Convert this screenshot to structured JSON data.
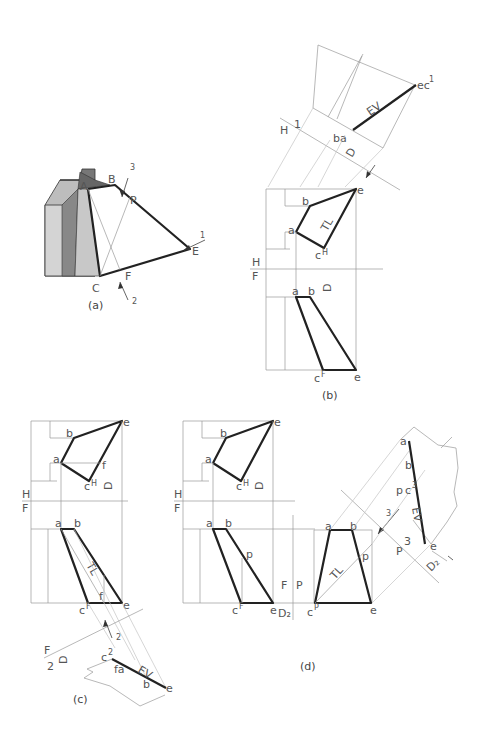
{
  "figure": {
    "panels": [
      {
        "id": "a",
        "caption": "(a)",
        "labels": [
          "A",
          "B",
          "P",
          "E",
          "F",
          "C"
        ],
        "arrows": [
          "1",
          "2",
          "3"
        ]
      },
      {
        "id": "b",
        "caption": "(b)",
        "fold_lines": [
          {
            "top": "H",
            "bottom": "F"
          },
          {
            "top": "H",
            "side": "1"
          }
        ],
        "top_view_labels": [
          "e",
          "b",
          "a",
          "c",
          "H",
          "TL"
        ],
        "front_view_labels": [
          "a",
          "b",
          "c",
          "F",
          "e"
        ],
        "aux_labels": [
          "ba",
          "ec",
          "1",
          "EV"
        ],
        "dimension": "D"
      },
      {
        "id": "c",
        "caption": "(c)",
        "fold_lines": [
          {
            "top": "H",
            "bottom": "F"
          },
          {
            "top": "F",
            "bottom": "2"
          }
        ],
        "top_view_labels": [
          "e",
          "b",
          "a",
          "f",
          "c",
          "H"
        ],
        "front_view_labels": [
          "a",
          "b",
          "TL",
          "f",
          "c",
          "F",
          "e"
        ],
        "aux_labels": [
          "c",
          "2",
          "f",
          "a",
          "EV",
          "b",
          "e"
        ],
        "dimension": "D",
        "arrow": "2"
      },
      {
        "id": "d",
        "caption": "(d)",
        "fold_lines": [
          {
            "top": "H",
            "bottom": "F"
          },
          {
            "left": "F",
            "right": "P"
          },
          {
            "left": "P",
            "right": "3"
          }
        ],
        "top_view_labels": [
          "e",
          "b",
          "a",
          "c",
          "H"
        ],
        "front_view_labels": [
          "a",
          "b",
          "p",
          "c",
          "F",
          "e"
        ],
        "profile_view_labels": [
          "a",
          "b",
          "p",
          "TL",
          "c",
          "P",
          "e"
        ],
        "aux_labels": [
          "a",
          "b",
          "p",
          "c",
          "3",
          "EV",
          "e"
        ],
        "dimensions": [
          "D",
          "D2",
          "D2"
        ],
        "arrow": "3"
      }
    ]
  },
  "text": {
    "A": "A",
    "B": "B",
    "P": "P",
    "E": "E",
    "F": "F",
    "C": "C",
    "one": "1",
    "two": "2",
    "three": "3",
    "a": "a",
    "b": "b",
    "c": "c",
    "e": "e",
    "f": "f",
    "p": "p",
    "H": "H",
    "FF": "F",
    "PP": "P",
    "TL": "TL",
    "EV": "EV",
    "D": "D",
    "D2": "D₂",
    "ba": "ba",
    "fa": "fa",
    "ec": "ec",
    "sup1": "1",
    "sup2": "2",
    "sup3": "3",
    "supH": "H",
    "supF": "F",
    "supP": "P",
    "cap_a": "(a)",
    "cap_b": "(b)",
    "cap_c": "(c)",
    "cap_d": "(d)"
  }
}
